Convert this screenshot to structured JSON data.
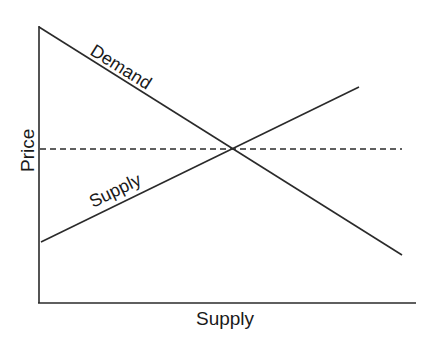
{
  "axes": {
    "x_label": "Supply",
    "y_label": "Price"
  },
  "curves": [
    {
      "name": "Demand",
      "label": "Demand",
      "from": [
        39,
        27
      ],
      "to": [
        402,
        255
      ]
    },
    {
      "name": "Supply",
      "label": "Supply",
      "from": [
        41,
        242
      ],
      "to": [
        359,
        87
      ]
    }
  ],
  "equilibrium_line": {
    "style": "dashed",
    "y": 149,
    "x_from": 39,
    "x_to": 402
  },
  "equilibrium_point": [
    233,
    149
  ],
  "colors": {
    "line": "#2a2a2a",
    "background": "#ffffff"
  }
}
